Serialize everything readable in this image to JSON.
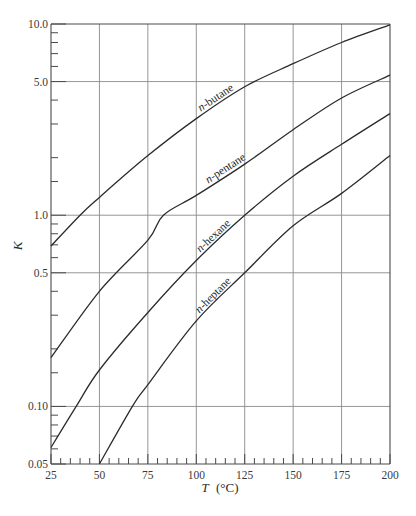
{
  "chart_data": {
    "type": "line",
    "title": "",
    "xlabel": "T (°C)",
    "ylabel": "K",
    "xscale": "linear",
    "yscale": "log",
    "xlim": [
      25,
      200
    ],
    "ylim": [
      0.05,
      10.0
    ],
    "grid": true,
    "legend": "inline curve labels",
    "x_ticks": [
      25,
      50,
      75,
      100,
      125,
      150,
      175,
      200
    ],
    "x_tick_labels": [
      "25",
      "50",
      "75",
      "100",
      "125",
      "150",
      "175",
      "200"
    ],
    "y_ticks": [
      0.05,
      0.1,
      0.5,
      1.0,
      5.0,
      10.0
    ],
    "y_tick_labels": [
      "0.05",
      "0.10",
      "0.5",
      "1.0",
      "5.0",
      "10.0"
    ],
    "y_gridlines": [
      0.1,
      0.5,
      1.0,
      5.0
    ],
    "x": [
      25,
      50,
      75,
      100,
      125,
      150,
      175,
      200
    ],
    "series": [
      {
        "name": "n-butane",
        "label_italic_prefix": "n",
        "label_rest": "-butane",
        "x": [
          25,
          40,
          50,
          75,
          100,
          125,
          150,
          175,
          200
        ],
        "values": [
          0.69,
          1.0,
          1.24,
          2.05,
          3.2,
          4.7,
          6.2,
          8.0,
          9.9
        ]
      },
      {
        "name": "n-pentane",
        "label_italic_prefix": "n",
        "label_rest": "-pentane",
        "x": [
          25,
          50,
          75,
          83,
          100,
          125,
          150,
          175,
          200
        ],
        "values": [
          0.18,
          0.4,
          0.74,
          1.0,
          1.27,
          1.85,
          2.8,
          4.1,
          5.4
        ]
      },
      {
        "name": "n-hexane",
        "label_italic_prefix": "n",
        "label_rest": "-hexane",
        "x": [
          25,
          38,
          50,
          75,
          100,
          125,
          150,
          175,
          200
        ],
        "values": [
          0.061,
          0.1,
          0.155,
          0.31,
          0.58,
          1.0,
          1.6,
          2.35,
          3.4
        ]
      },
      {
        "name": "n-heptane",
        "label_italic_prefix": "n",
        "label_rest": "-heptane",
        "x": [
          50,
          67,
          75,
          100,
          125,
          150,
          175,
          200
        ],
        "values": [
          0.05,
          0.1,
          0.13,
          0.28,
          0.5,
          0.88,
          1.3,
          2.05
        ]
      }
    ],
    "annotations": [
      "n-butane",
      "n-pentane",
      "n-hexane",
      "n-heptane"
    ]
  },
  "labels": {
    "ylabel": "K",
    "xlabel_var": "T",
    "xlabel_unit": "(°C)"
  }
}
